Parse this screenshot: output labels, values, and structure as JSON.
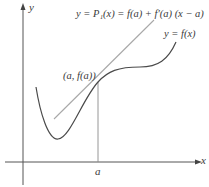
{
  "diagram": {
    "axes": {
      "x_label": "x",
      "y_label": "y"
    },
    "tick": {
      "label": "a"
    },
    "point_label": "(a, f(a))",
    "tangent_label": "y = P₁(x) = f(a) + f′(a) (x − a)",
    "curve_label": "y = f(x)",
    "colors": {
      "axis": "#555555",
      "curve": "#4a4a4a",
      "tangent": "#a8a8a8",
      "guide": "#8a8a8a",
      "text": "#3a3a3a"
    }
  }
}
